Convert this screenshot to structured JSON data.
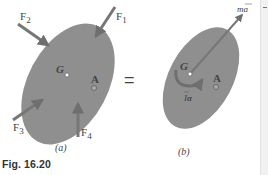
{
  "figure": {
    "caption": "Fig. 16.20",
    "equals_sign": "=",
    "colors": {
      "body_fill": "#8f8f8f",
      "arrow": "#777777",
      "text": "#444444",
      "background": "#ffffff"
    },
    "panel_a": {
      "label": "(a)",
      "forces": [
        "F1",
        "F2",
        "F3",
        "F4"
      ],
      "force_labels": {
        "F1": {
          "base": "F",
          "sub": "1"
        },
        "F2": {
          "base": "F",
          "sub": "2"
        },
        "F3": {
          "base": "F",
          "sub": "3"
        },
        "F4": {
          "base": "F",
          "sub": "4"
        }
      },
      "points": {
        "G": "G",
        "A": "A"
      }
    },
    "panel_b": {
      "label": "(b)",
      "vector_label": "mā",
      "vector_base": "m",
      "vector_sym": "a",
      "couple_label": "Īα",
      "couple_base": "I",
      "couple_sym": "α",
      "points": {
        "G": "G",
        "A": "A"
      }
    }
  }
}
